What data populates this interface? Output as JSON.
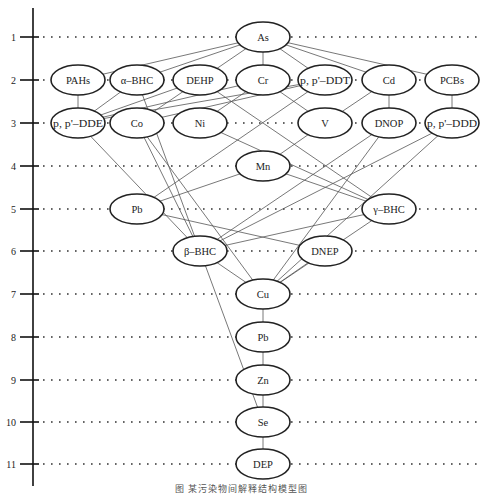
{
  "diagram": {
    "title": "",
    "caption": "图    某污染物间解释结构模型图",
    "axis": {
      "x": 33,
      "top": 8,
      "bottom": 486,
      "levels": [
        {
          "label": "1",
          "y": 37
        },
        {
          "label": "2",
          "y": 80
        },
        {
          "label": "3",
          "y": 123
        },
        {
          "label": "4",
          "y": 166
        },
        {
          "label": "5",
          "y": 209
        },
        {
          "label": "6",
          "y": 251
        },
        {
          "label": "7",
          "y": 294
        },
        {
          "label": "8",
          "y": 337
        },
        {
          "label": "9",
          "y": 380
        },
        {
          "label": "10",
          "y": 422
        },
        {
          "label": "11",
          "y": 464
        }
      ]
    },
    "nodes": [
      {
        "id": "As",
        "label": "As",
        "level": 1,
        "cx": 263
      },
      {
        "id": "PAHs",
        "label": "PAHs",
        "level": 2,
        "cx": 78
      },
      {
        "id": "aBHC",
        "label": "α–BHC",
        "level": 2,
        "cx": 137
      },
      {
        "id": "DEHP",
        "label": "DEHP",
        "level": 2,
        "cx": 200
      },
      {
        "id": "Cr",
        "label": "Cr",
        "level": 2,
        "cx": 263
      },
      {
        "id": "ppDDT",
        "label": "p, p'–DDT",
        "level": 2,
        "cx": 325
      },
      {
        "id": "Cd",
        "label": "Cd",
        "level": 2,
        "cx": 389
      },
      {
        "id": "PCBs",
        "label": "PCBs",
        "level": 2,
        "cx": 452
      },
      {
        "id": "ppDDE",
        "label": "p, p'–DDE",
        "level": 3,
        "cx": 78
      },
      {
        "id": "Co",
        "label": "Co",
        "level": 3,
        "cx": 137
      },
      {
        "id": "Ni",
        "label": "Ni",
        "level": 3,
        "cx": 200
      },
      {
        "id": "V",
        "label": "V",
        "level": 3,
        "cx": 325
      },
      {
        "id": "DNOP",
        "label": "DNOP",
        "level": 3,
        "cx": 389
      },
      {
        "id": "ppDDD",
        "label": "p, p'–DDD",
        "level": 3,
        "cx": 452
      },
      {
        "id": "Mn",
        "label": "Mn",
        "level": 4,
        "cx": 263
      },
      {
        "id": "Pb1",
        "label": "Pb",
        "level": 5,
        "cx": 137
      },
      {
        "id": "gBHC",
        "label": "γ–BHC",
        "level": 5,
        "cx": 389
      },
      {
        "id": "bBHC",
        "label": "β–BHC",
        "level": 6,
        "cx": 200
      },
      {
        "id": "DNEP",
        "label": "DNEP",
        "level": 6,
        "cx": 325
      },
      {
        "id": "Cu",
        "label": "Cu",
        "level": 7,
        "cx": 263
      },
      {
        "id": "Pb2",
        "label": "Pb",
        "level": 8,
        "cx": 263
      },
      {
        "id": "Zn",
        "label": "Zn",
        "level": 9,
        "cx": 263
      },
      {
        "id": "Se",
        "label": "Se",
        "level": 10,
        "cx": 263
      },
      {
        "id": "DEP",
        "label": "DEP",
        "level": 11,
        "cx": 263
      }
    ],
    "edges": [
      [
        "As",
        "PAHs"
      ],
      [
        "As",
        "aBHC"
      ],
      [
        "As",
        "DEHP"
      ],
      [
        "As",
        "Cr"
      ],
      [
        "As",
        "ppDDT"
      ],
      [
        "As",
        "Cd"
      ],
      [
        "As",
        "PCBs"
      ],
      [
        "PAHs",
        "ppDDE"
      ],
      [
        "aBHC",
        "ppDDE"
      ],
      [
        "DEHP",
        "ppDDE"
      ],
      [
        "Cr",
        "ppDDE"
      ],
      [
        "ppDDT",
        "ppDDE"
      ],
      [
        "DEHP",
        "Co"
      ],
      [
        "ppDDT",
        "Co"
      ],
      [
        "Cr",
        "Ni"
      ],
      [
        "Cr",
        "V"
      ],
      [
        "Cd",
        "V"
      ],
      [
        "Cd",
        "DNOP"
      ],
      [
        "PCBs",
        "ppDDD"
      ],
      [
        "ppDDT",
        "Pb1"
      ],
      [
        "aBHC",
        "Se"
      ],
      [
        "DEHP",
        "gBHC"
      ],
      [
        "Ni",
        "gBHC"
      ],
      [
        "V",
        "Mn"
      ],
      [
        "Mn",
        "Pb1"
      ],
      [
        "Mn",
        "gBHC"
      ],
      [
        "ppDDE",
        "bBHC"
      ],
      [
        "Co",
        "bBHC"
      ],
      [
        "Co",
        "Cu"
      ],
      [
        "Pb1",
        "DNEP"
      ],
      [
        "DNOP",
        "bBHC"
      ],
      [
        "ppDDD",
        "bBHC"
      ],
      [
        "gBHC",
        "bBHC"
      ],
      [
        "DNOP",
        "Cu"
      ],
      [
        "ppDDD",
        "Cu"
      ],
      [
        "gBHC",
        "Cu"
      ],
      [
        "DNEP",
        "Cu"
      ],
      [
        "bBHC",
        "Cu"
      ],
      [
        "Cu",
        "Pb2"
      ],
      [
        "Pb2",
        "Zn"
      ],
      [
        "Zn",
        "Se"
      ],
      [
        "Se",
        "DEP"
      ]
    ],
    "style": {
      "line_color": "#555555",
      "node_stroke": "#222222",
      "axis_color": "#111111",
      "dot_color": "#333333"
    }
  }
}
